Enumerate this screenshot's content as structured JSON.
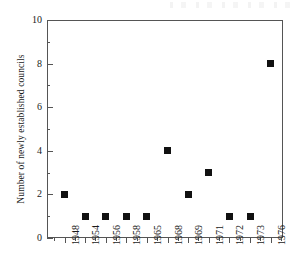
{
  "chart_data": {
    "type": "scatter",
    "title": "",
    "xlabel": "",
    "ylabel": "Number of newly established councils",
    "categories": [
      "1948",
      "1954",
      "1956",
      "1958",
      "1965",
      "1968",
      "1969",
      "1971",
      "1972",
      "1973",
      "1976"
    ],
    "values": [
      2,
      1,
      1,
      1,
      1,
      4,
      2,
      3,
      1,
      1,
      8
    ],
    "series": [
      {
        "name": "Newly established councils",
        "values": [
          2,
          1,
          1,
          1,
          1,
          4,
          2,
          3,
          1,
          1,
          8
        ]
      }
    ],
    "ylim": [
      0,
      10
    ],
    "y_ticks": [
      0,
      2,
      4,
      6,
      8,
      10
    ],
    "y_tick_labels": [
      "0",
      "2",
      "4",
      "6",
      "8",
      "10"
    ],
    "y_minor_ticks": [
      1,
      3,
      5,
      7,
      9
    ],
    "grid": false,
    "legend": false,
    "legend_position": "none",
    "marker": "square",
    "marker_color": "#111111",
    "axis_color": "#555555",
    "background_color": "#ffffff",
    "points": [
      {
        "x": "1948",
        "y": 2
      },
      {
        "x": "1954",
        "y": 1
      },
      {
        "x": "1956",
        "y": 1
      },
      {
        "x": "1958",
        "y": 1
      },
      {
        "x": "1965",
        "y": 1
      },
      {
        "x": "1968",
        "y": 4
      },
      {
        "x": "1969",
        "y": 2
      },
      {
        "x": "1971",
        "y": 3
      },
      {
        "x": "1972",
        "y": 1
      },
      {
        "x": "1973",
        "y": 1
      },
      {
        "x": "1976",
        "y": 8
      }
    ]
  }
}
